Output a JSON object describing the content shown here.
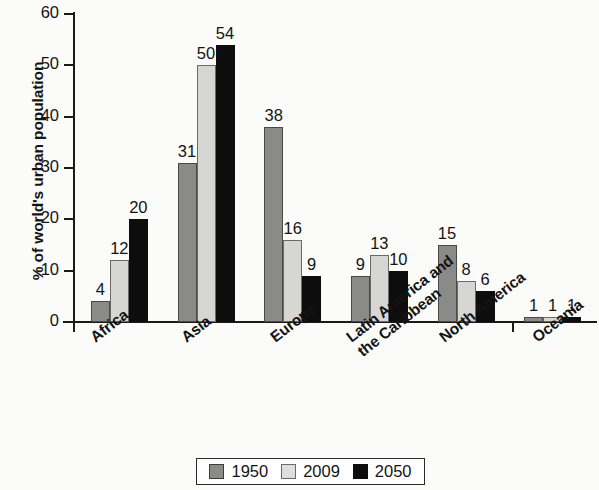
{
  "chart_data": {
    "type": "bar",
    "title": "",
    "xlabel": "",
    "ylabel": "% of world's urban population",
    "ylim": [
      0,
      60
    ],
    "ytick_labels": [
      "0",
      "10",
      "20",
      "30",
      "40",
      "50",
      "60"
    ],
    "ytick_values": [
      0,
      10,
      20,
      30,
      40,
      50,
      60
    ],
    "grid": false,
    "legend_position": "bottom",
    "categories": [
      "Africa",
      "Asia",
      "Europe",
      "Latin America and\nthe Caribbean",
      "North America",
      "Oceania"
    ],
    "category_lines": [
      [
        "Africa"
      ],
      [
        "Asia"
      ],
      [
        "Europe"
      ],
      [
        "Latin America and",
        "the Caribbean"
      ],
      [
        "North America"
      ],
      [
        "Oceania"
      ]
    ],
    "series": [
      {
        "name": "1950",
        "color": "#8a8a88",
        "values": [
          4,
          31,
          38,
          9,
          15,
          1
        ]
      },
      {
        "name": "2009",
        "color": "#d6d6d2",
        "values": [
          12,
          50,
          16,
          13,
          8,
          1
        ]
      },
      {
        "name": "2050",
        "color": "#0d0d0d",
        "values": [
          20,
          54,
          9,
          10,
          6,
          1
        ]
      }
    ],
    "data_labels": [
      [
        "4",
        "12",
        "20"
      ],
      [
        "31",
        "50",
        "54"
      ],
      [
        "38",
        "16",
        "9"
      ],
      [
        "9",
        "13",
        "10"
      ],
      [
        "15",
        "8",
        "6"
      ],
      [
        "1",
        "1",
        "1"
      ]
    ]
  },
  "legend": {
    "items": [
      {
        "label": "1950",
        "swatch": "series-1950-swatch"
      },
      {
        "label": "2009",
        "swatch": "series-2009-swatch"
      },
      {
        "label": "2050",
        "swatch": "series-2050-swatch"
      }
    ]
  }
}
